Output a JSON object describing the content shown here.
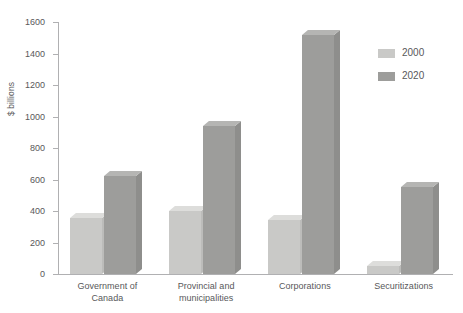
{
  "chart_data": {
    "type": "bar",
    "title": "",
    "xlabel": "",
    "ylabel": "$ billions",
    "ylim": [
      0,
      1600
    ],
    "yticks": [
      0,
      200,
      400,
      600,
      800,
      1000,
      1200,
      1400,
      1600
    ],
    "ytick_labels": [
      "0",
      "200",
      "400",
      "600",
      "800",
      "1000",
      "1200",
      "1400",
      "1600"
    ],
    "grid": false,
    "legend_position": "upper-right",
    "categories": [
      "Government of Canada",
      "Provincial and municipalities",
      "Corporations",
      "Securitizations"
    ],
    "category_lines": [
      [
        "Government of",
        "Canada"
      ],
      [
        "Provincial and",
        "municipalities"
      ],
      [
        "Corporations",
        ""
      ],
      [
        "Securitizations",
        ""
      ]
    ],
    "series": [
      {
        "name": "2000",
        "color": "#c9c9c7",
        "values": [
          355,
          400,
          345,
          50
        ]
      },
      {
        "name": "2020",
        "color": "#9d9d9b",
        "values": [
          620,
          940,
          1520,
          555
        ]
      }
    ]
  },
  "legend": {
    "items": [
      {
        "label": "2000",
        "color": "#c9c9c7"
      },
      {
        "label": "2020",
        "color": "#9d9d9b"
      }
    ]
  },
  "colors": {
    "axis": "#b0b0b2",
    "text": "#58585a",
    "background": "#ffffff",
    "series_2000": "#c9c9c7",
    "series_2020": "#9d9d9b"
  }
}
